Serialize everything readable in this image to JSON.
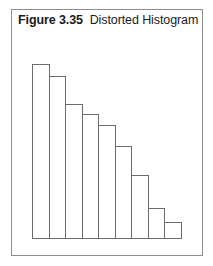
{
  "figure": {
    "label": "Figure 3.35",
    "title": "Distorted Histogram",
    "caption_full": "Figure 3.35  Distorted Histogram"
  },
  "colors": {
    "page_background": "#ffffff",
    "panel_background": "#ffffff",
    "panel_border": "#8e8e8e",
    "bar_stroke": "#6d6d6d",
    "bar_fill": "#ffffff",
    "caption_text": "#1a1a1a"
  },
  "chart_data": {
    "type": "bar",
    "title": "Distorted Histogram",
    "xlabel": "",
    "ylabel": "",
    "grid": false,
    "legend": false,
    "axis_labels_shown": false,
    "tick_labels_shown": false,
    "categories": [
      "1",
      "2",
      "3",
      "4",
      "5",
      "6",
      "7",
      "8",
      "9"
    ],
    "values": [
      100,
      93,
      77,
      71,
      65,
      53,
      36,
      17,
      9
    ],
    "ylim": [
      0,
      100
    ],
    "xlim": [
      0,
      9
    ],
    "bar_count": 9,
    "bar_gap": 0,
    "orientation": "vertical",
    "note": "Heights are relative units read off the plotted bar tops; no numeric axis is printed in the figure."
  }
}
